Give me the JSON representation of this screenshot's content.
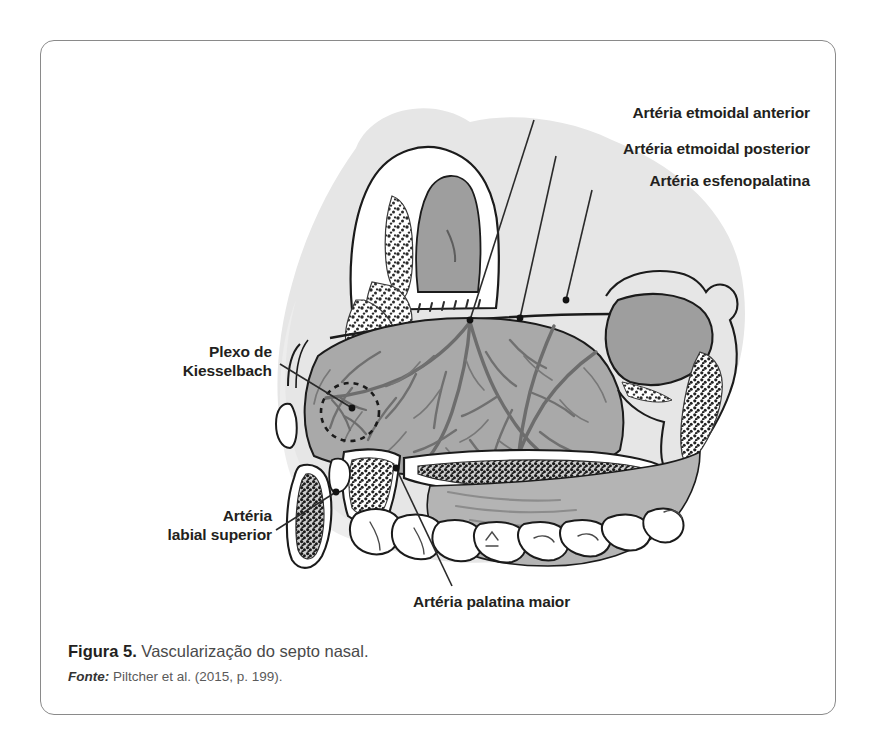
{
  "figure": {
    "caption_prefix": "Figura 5.",
    "caption_text": " Vascularização do septo nasal.",
    "source_prefix": "Fonte:",
    "source_text": " Piltcher et al. (2015, p. 199).",
    "border_color": "#8a8a8a",
    "background_color": "#ffffff"
  },
  "illustration": {
    "title": "Vascularização do septo nasal",
    "type": "sagittal-anatomical-diagram",
    "palette": {
      "head_silhouette": "#e6e6e6",
      "septum_fill": "#a9a9a9",
      "sinus_fill": "#9e9e9e",
      "vessel": "#6d6d6d",
      "outline": "#1b1b1b",
      "bone_stipple": "#2b2b2b",
      "tooth_fill": "#ffffff",
      "leader_line": "#2a2a2a"
    }
  },
  "labels": [
    {
      "id": "aea",
      "name": "arteria-etmoidal-anterior",
      "text": "Artéria etmoidal anterior"
    },
    {
      "id": "aep",
      "name": "arteria-etmoidal-posterior",
      "text": "Artéria etmoidal posterior"
    },
    {
      "id": "aesf",
      "name": "arteria-esfenopalatina",
      "text": "Artéria esfenopalatina"
    },
    {
      "id": "plexo",
      "name": "plexo-de-kiesselbach",
      "text": "Plexo de\nKiesselbach"
    },
    {
      "id": "labial",
      "name": "arteria-labial-superior",
      "text": "Artéria\nlabial superior"
    },
    {
      "id": "palatina",
      "name": "arteria-palatina-maior",
      "text": "Artéria palatina maior"
    }
  ]
}
